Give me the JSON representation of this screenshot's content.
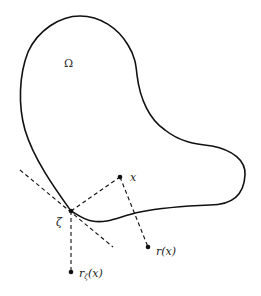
{
  "figure": {
    "domain_label": "Ω",
    "points": {
      "x": {
        "label": "x",
        "cx": 120,
        "cy": 177
      },
      "zeta": {
        "label": "ζ",
        "cx": 71,
        "cy": 211
      },
      "r_x": {
        "label": "r(x)",
        "cx": 148,
        "cy": 247
      },
      "r_zeta_x": {
        "label_main": "r",
        "label_sub": "ζ",
        "label_arg": "(x)",
        "cx": 71,
        "cy": 272
      }
    },
    "colors": {
      "stroke": "#111111",
      "background": "#ffffff"
    }
  }
}
